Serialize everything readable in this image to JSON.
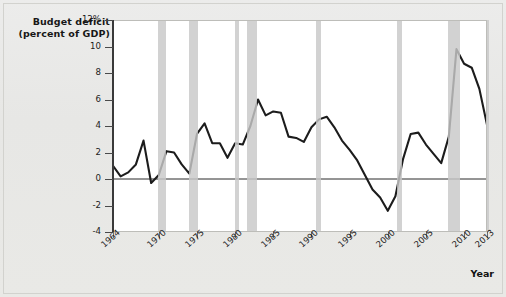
{
  "axis_title": {
    "line1": "Budget deficit",
    "line2": "(percent of GDP)"
  },
  "xaxis_title": "Year",
  "chart_data": {
    "type": "line",
    "title": "Budget deficit (percent of GDP)",
    "xlabel": "Year",
    "ylabel": "Budget deficit (percent of GDP)",
    "xlim": [
      1964,
      2013
    ],
    "ylim": [
      -4,
      12
    ],
    "ytick_labels": [
      "12%",
      "10",
      "8",
      "6",
      "4",
      "2",
      "0",
      "-2",
      "-4"
    ],
    "yticks": [
      12,
      10,
      8,
      6,
      4,
      2,
      0,
      -2,
      -4
    ],
    "xticks": [
      1964,
      1970,
      1975,
      1980,
      1985,
      1990,
      1995,
      2000,
      2005,
      2010,
      2013
    ],
    "xtick_labels": [
      "1964",
      "1970",
      "1975",
      "1980",
      "1985",
      "1990",
      "1995",
      "2000",
      "2005",
      "2010",
      "2013"
    ],
    "grid": false,
    "legend": false,
    "zero_line": 0,
    "line_color": "#1c1c1c",
    "recession_band_color": "#c8c8c8",
    "plot_background": "#ffffff",
    "figure_background": "#e9e9e7",
    "x": [
      1964,
      1965,
      1966,
      1967,
      1968,
      1969,
      1970,
      1971,
      1972,
      1973,
      1974,
      1975,
      1976,
      1977,
      1978,
      1979,
      1980,
      1981,
      1982,
      1983,
      1984,
      1985,
      1986,
      1987,
      1988,
      1989,
      1990,
      1991,
      1992,
      1993,
      1994,
      1995,
      1996,
      1997,
      1998,
      1999,
      2000,
      2001,
      2002,
      2003,
      2004,
      2005,
      2006,
      2007,
      2008,
      2009,
      2010,
      2011,
      2012,
      2013
    ],
    "values": [
      1.0,
      0.2,
      0.5,
      1.1,
      2.9,
      -0.3,
      0.3,
      2.1,
      2.0,
      1.1,
      0.4,
      3.4,
      4.2,
      2.7,
      2.7,
      1.6,
      2.7,
      2.6,
      4.0,
      6.0,
      4.8,
      5.1,
      5.0,
      3.2,
      3.1,
      2.8,
      3.9,
      4.5,
      4.7,
      3.9,
      2.9,
      2.2,
      1.4,
      0.3,
      -0.8,
      -1.4,
      -2.4,
      -1.3,
      1.5,
      3.4,
      3.5,
      2.6,
      1.9,
      1.2,
      3.2,
      9.8,
      8.7,
      8.4,
      6.8,
      4.1
    ],
    "recessions": [
      {
        "start": 1969.9,
        "end": 1970.9
      },
      {
        "start": 1973.9,
        "end": 1975.2
      },
      {
        "start": 1980.0,
        "end": 1980.5
      },
      {
        "start": 1981.5,
        "end": 1982.9
      },
      {
        "start": 1990.6,
        "end": 1991.2
      },
      {
        "start": 2001.2,
        "end": 2001.9
      },
      {
        "start": 2007.9,
        "end": 2009.5
      },
      {
        "start": 2012.9,
        "end": 2013.2
      }
    ]
  }
}
